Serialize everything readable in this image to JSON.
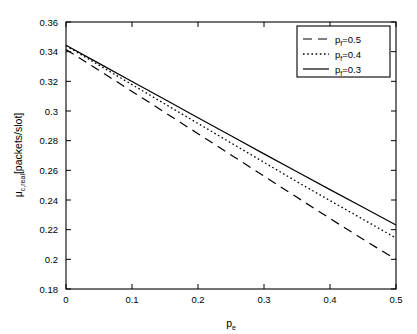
{
  "chart_data": {
    "type": "line",
    "title": "",
    "xlabel": "p_e",
    "xlabel_base": "p",
    "xlabel_sub": "e",
    "ylabel": "μ_c,real[packets/slot]",
    "ylabel_base": "μ",
    "ylabel_sub": "c,real",
    "ylabel_tail": "[packets/slot]",
    "xlim": [
      0,
      0.5
    ],
    "ylim": [
      0.18,
      0.36
    ],
    "grid": false,
    "legend_position": "upper-right",
    "xticks": [
      0,
      0.1,
      0.2,
      0.3,
      0.4,
      0.5
    ],
    "xtick_labels": [
      "0",
      "0.1",
      "0.2",
      "0.3",
      "0.4",
      "0.5"
    ],
    "yticks": [
      0.18,
      0.2,
      0.22,
      0.24,
      0.26,
      0.28,
      0.3,
      0.32,
      0.34,
      0.36
    ],
    "ytick_labels": [
      "0.18",
      "0.2",
      "0.22",
      "0.24",
      "0.26",
      "0.28",
      "0.3",
      "0.32",
      "0.34",
      "0.36"
    ],
    "x": [
      0,
      0.05,
      0.1,
      0.15,
      0.2,
      0.25,
      0.3,
      0.35,
      0.4,
      0.45,
      0.5
    ],
    "series": [
      {
        "name": "p_f=0.5",
        "label_base": "p",
        "label_sub": "f",
        "label_tail": "=0.5",
        "style": "dashed",
        "color": "#000000",
        "values": [
          0.3415,
          0.3274,
          0.3132,
          0.299,
          0.2847,
          0.2704,
          0.2561,
          0.2418,
          0.2275,
          0.2135,
          0.2
        ]
      },
      {
        "name": "p_f=0.4",
        "label_base": "p",
        "label_sub": "f",
        "label_tail": "=0.4",
        "style": "dotted",
        "color": "#000000",
        "values": [
          0.344,
          0.3309,
          0.3178,
          0.3047,
          0.2916,
          0.2785,
          0.2654,
          0.2523,
          0.2396,
          0.227,
          0.2143
        ]
      },
      {
        "name": "p_f=0.3",
        "label_base": "p",
        "label_sub": "f",
        "label_tail": "=0.3",
        "style": "solid",
        "color": "#000000",
        "values": [
          0.3443,
          0.3321,
          0.3199,
          0.3077,
          0.2955,
          0.2833,
          0.2711,
          0.259,
          0.247,
          0.2351,
          0.2232
        ]
      }
    ]
  },
  "legend": {
    "entries": [
      {
        "label_base": "p",
        "label_sub": "f",
        "label_tail": "=0.5"
      },
      {
        "label_base": "p",
        "label_sub": "f",
        "label_tail": "=0.4"
      },
      {
        "label_base": "p",
        "label_sub": "f",
        "label_tail": "=0.3"
      }
    ]
  },
  "axis": {
    "x_title_base": "p",
    "x_title_sub": "e",
    "y_title_base": "μ",
    "y_title_sub": "c,real",
    "y_title_tail": "[packets/slot]"
  }
}
